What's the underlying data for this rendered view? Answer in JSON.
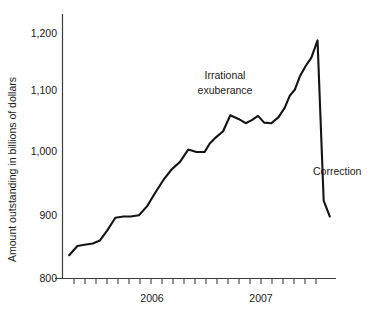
{
  "chart_data": {
    "type": "line",
    "title": "",
    "subtitle": "",
    "xlabel": "",
    "ylabel": "Amount outstanding in billions of dollars",
    "ylim": [
      800,
      1200
    ],
    "ytick_labels": [
      "800",
      "900",
      "1,000",
      "1,100",
      "1,200"
    ],
    "ytick_values": [
      800,
      900,
      1000,
      1100,
      1200
    ],
    "xtick_labels": [
      "2006",
      "2007"
    ],
    "xtick_label_positions": [
      8,
      20
    ],
    "grid": false,
    "legend": null,
    "n_minor_ticks": 24,
    "annotations": [
      {
        "name": "irrational-exuberance",
        "lines": [
          "Irrational",
          "exuberance"
        ],
        "x": 225,
        "y": 75
      },
      {
        "name": "correction",
        "lines": [
          "Correction"
        ],
        "x": 313,
        "y": 171
      }
    ],
    "series": [
      {
        "name": "Amount outstanding",
        "x": [
          0.6,
          1.4,
          2.1,
          2.9,
          3.6,
          4.3,
          5.1,
          5.9,
          6.6,
          7.4,
          8.2,
          9.0,
          9.8,
          10.6,
          11.4,
          12.2,
          13.0,
          13.8,
          14.3,
          14.9,
          15.6,
          16.3,
          17.1,
          17.8,
          18.4,
          19.0,
          19.6,
          20.3,
          21.0,
          21.6,
          22.1,
          22.6,
          23.1,
          23.6,
          24.2,
          24.8,
          25.4,
          26.0
        ],
        "values": [
          838,
          853,
          855,
          857,
          862,
          878,
          899,
          901,
          901,
          903,
          918,
          940,
          961,
          978,
          990,
          1010,
          1006,
          1006,
          1020,
          1030,
          1040,
          1066,
          1060,
          1053,
          1058,
          1065,
          1054,
          1053,
          1063,
          1078,
          1098,
          1108,
          1130,
          1145,
          1160,
          1188,
          927,
          901
        ]
      }
    ]
  },
  "axis": {
    "y_axis_name": "y-axis",
    "x_axis_name": "x-axis"
  }
}
